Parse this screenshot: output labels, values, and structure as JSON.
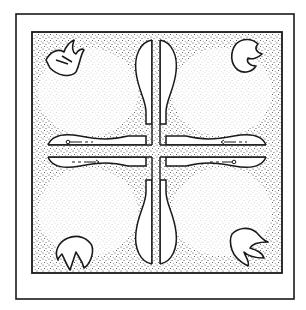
{
  "figure": {
    "colors": {
      "background": "#ffffff",
      "ink": "#1a1a1a",
      "stipple": "#3a3a3a"
    },
    "outer_frame": {
      "x": 16,
      "y": 14,
      "width": 278,
      "height": 285
    },
    "inner_field": {
      "x": 32,
      "y": 32,
      "width": 250,
      "height": 241
    },
    "motifs": [
      {
        "name": "claw-top-left",
        "position": "top-left"
      },
      {
        "name": "claw-top-right",
        "position": "top-right"
      },
      {
        "name": "claw-bottom-left",
        "position": "bottom-left"
      },
      {
        "name": "claw-bottom-right",
        "position": "bottom-right"
      }
    ],
    "arrows": [
      {
        "position": "left-upper",
        "direction": "left"
      },
      {
        "position": "left-lower",
        "direction": "right"
      },
      {
        "position": "right-upper",
        "direction": "left"
      },
      {
        "position": "right-lower",
        "direction": "right"
      }
    ]
  }
}
